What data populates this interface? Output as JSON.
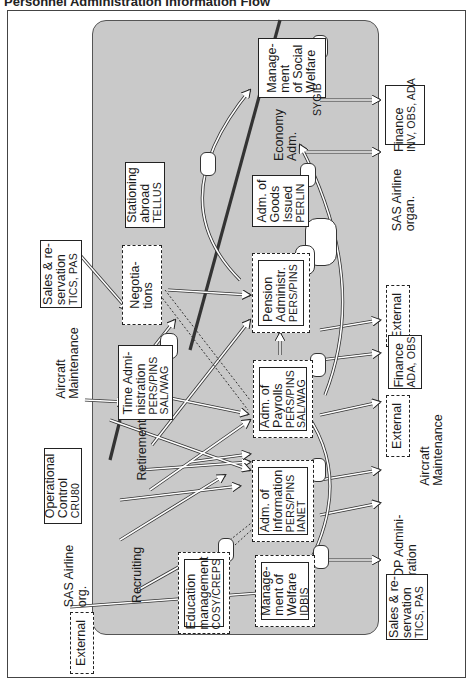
{
  "title": "Personnel Administration Information Flow",
  "internal_systems": [
    {
      "id": "social-welfare",
      "lines": [
        "Manage-",
        "ment",
        "of Social",
        "Welfare"
      ],
      "code": "SYGIB"
    },
    {
      "id": "economy",
      "lines": [
        "Economy",
        "Adm."
      ]
    },
    {
      "id": "goods-issued",
      "lines": [
        "Adm. of",
        "Goods",
        "Issued"
      ],
      "code": "PERLIN"
    },
    {
      "id": "stationing",
      "lines": [
        "Stationing",
        "abroad"
      ],
      "code": "TELLUS"
    },
    {
      "id": "negotiations",
      "lines": [
        "Negotia-",
        "tions"
      ]
    },
    {
      "id": "pension",
      "lines": [
        "Pension",
        "Administr."
      ],
      "code": "PERS/PINS"
    },
    {
      "id": "time-admin",
      "lines": [
        "Time Admi-",
        "nistration"
      ],
      "code": "PERS/PINS",
      "code2": "SAL/WAG"
    },
    {
      "id": "payrolls",
      "lines": [
        "Adm. of",
        "Payrolls"
      ],
      "code": "PERS/PINS",
      "code2": "SAL/WAG"
    },
    {
      "id": "retirement",
      "lines": [
        "Retirement"
      ]
    },
    {
      "id": "information",
      "lines": [
        "Adm. of",
        "Information"
      ],
      "code": "PERS/PINS",
      "code2": "IANET"
    },
    {
      "id": "recruiting",
      "lines": [
        "Recruiting"
      ]
    },
    {
      "id": "education",
      "lines": [
        "Education",
        "management"
      ],
      "code": "COSY/CREPS"
    },
    {
      "id": "welfare",
      "lines": [
        "Manage-",
        "ment of",
        "Welfare"
      ],
      "code": "IDBIS"
    }
  ],
  "external_entities": [
    {
      "id": "finance-top",
      "lines": [
        "Finance"
      ],
      "code": "INV, OBS, ADA"
    },
    {
      "id": "sas-organ",
      "lines": [
        "SAS Airline",
        "organ."
      ]
    },
    {
      "id": "external-1",
      "lines": [
        "External"
      ]
    },
    {
      "id": "finance-mid",
      "lines": [
        "Finance"
      ],
      "code": "ADA, OBS"
    },
    {
      "id": "external-2",
      "lines": [
        "External"
      ]
    },
    {
      "id": "aircraft-right",
      "lines": [
        "Aircraft",
        "Maintenance"
      ]
    },
    {
      "id": "edp",
      "lines": [
        "EDP Admini-",
        "stration"
      ]
    },
    {
      "id": "sales-right",
      "lines": [
        "Sales & re-",
        "servation"
      ],
      "code": "TICS, PAS"
    },
    {
      "id": "sales-left",
      "lines": [
        "Sales & re-",
        "servation"
      ],
      "code": "TICS, PAS"
    },
    {
      "id": "aircraft-left",
      "lines": [
        "Aircraft",
        "Maintenance"
      ]
    },
    {
      "id": "operational",
      "lines": [
        "Operational",
        "Control"
      ],
      "code": "CRU80"
    },
    {
      "id": "sas-org",
      "lines": [
        "SAS Airline",
        "org."
      ]
    },
    {
      "id": "external-left",
      "lines": [
        "External"
      ]
    }
  ]
}
